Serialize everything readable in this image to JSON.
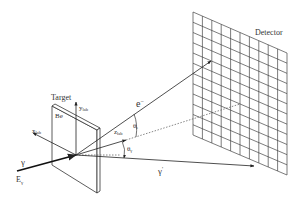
{
  "diagram": {
    "labels": {
      "detector": "Detector",
      "target": "Target",
      "material": "Be",
      "y_axis": "y",
      "y_axis_sub": "lab",
      "x_axis": "x",
      "x_axis_sub": "lab",
      "z_axis": "z",
      "z_axis_sub": "lab",
      "incident_photon": "γ",
      "photon_energy": "E",
      "photon_energy_sub": "γ",
      "electron": "e",
      "electron_sup": "−",
      "scattered_photon": "γ",
      "scattered_photon_sup": "'",
      "electron_angle": "θ",
      "electron_angle_sub": "e",
      "photon_angle": "θ",
      "photon_angle_sub": "γ"
    },
    "detector_grid": {
      "columns": 10,
      "rows": 12
    },
    "colors": {
      "line": "#333333",
      "background": "#ffffff"
    }
  }
}
